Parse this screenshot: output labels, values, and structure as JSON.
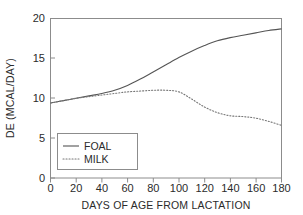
{
  "chart_data": {
    "type": "line",
    "title": "",
    "xlabel": "DAYS OF AGE FROM LACTATION",
    "ylabel": "DE (MCAL/DAY)",
    "xlim": [
      0,
      180
    ],
    "ylim": [
      0,
      20
    ],
    "xticks": [
      "0",
      "20",
      "40",
      "60",
      "80",
      "100",
      "120",
      "140",
      "160",
      "180"
    ],
    "yticks": [
      "0",
      "5",
      "10",
      "15",
      "20"
    ],
    "grid": false,
    "legend_position": "lower-left-inside",
    "x": [
      0,
      10,
      20,
      30,
      40,
      50,
      60,
      70,
      80,
      90,
      100,
      110,
      120,
      130,
      140,
      150,
      160,
      170,
      180
    ],
    "series": [
      {
        "name": "FOAL",
        "style": "solid",
        "color": "#555555",
        "values": [
          9.4,
          9.7,
          10.0,
          10.3,
          10.6,
          11.0,
          11.6,
          12.4,
          13.3,
          14.2,
          15.1,
          15.9,
          16.6,
          17.2,
          17.6,
          17.9,
          18.2,
          18.5,
          18.7
        ]
      },
      {
        "name": "MILK",
        "style": "dotted",
        "color": "#777777",
        "values": [
          9.4,
          9.7,
          10.0,
          10.2,
          10.4,
          10.6,
          10.8,
          10.9,
          11.0,
          11.0,
          10.8,
          9.9,
          8.9,
          8.2,
          7.8,
          7.7,
          7.5,
          7.1,
          6.6
        ]
      }
    ],
    "legend": [
      {
        "label": "FOAL",
        "style": "solid"
      },
      {
        "label": "MILK",
        "style": "dotted"
      }
    ]
  }
}
